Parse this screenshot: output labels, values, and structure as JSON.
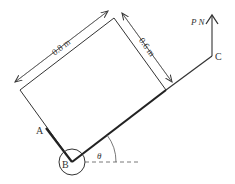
{
  "diagram": {
    "labels": {
      "A": "A",
      "B": "B",
      "C": "C",
      "force": "P N",
      "angle": "θ",
      "length_long": "0.8 m",
      "length_short": "0.6 m"
    },
    "colors": {
      "line": "#333333",
      "background": "#ffffff"
    }
  }
}
